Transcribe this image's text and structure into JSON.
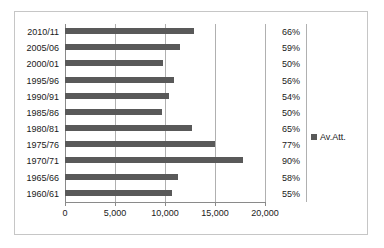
{
  "chart_data": {
    "type": "bar",
    "orientation": "horizontal",
    "title": "",
    "xlabel": "",
    "ylabel": "",
    "xlim": [
      0,
      20000
    ],
    "grid": true,
    "legend_position": "right",
    "categories": [
      "2010/11",
      "2005/06",
      "2000/01",
      "1995/96",
      "1990/91",
      "1985/86",
      "1980/81",
      "1975/76",
      "1970/71",
      "1965/66",
      "1960/61"
    ],
    "series": [
      {
        "name": "Av.Att.",
        "color": "#595959",
        "values": [
          12900,
          11500,
          9800,
          10900,
          10400,
          9700,
          12700,
          15000,
          17800,
          11300,
          10700
        ]
      }
    ],
    "point_labels": {
      "name": "percentage",
      "values": [
        "66%",
        "59%",
        "50%",
        "56%",
        "54%",
        "50%",
        "65%",
        "77%",
        "90%",
        "58%",
        "55%"
      ]
    },
    "xticks": [
      0,
      5000,
      10000,
      15000,
      20000
    ],
    "xtick_labels": [
      "0",
      "5,000",
      "10,000",
      "15,000",
      "20,000"
    ]
  },
  "legend": {
    "label": "Av.Att.",
    "swatch_color": "#595959"
  },
  "style": {
    "border_color": "#c6c6c6",
    "gridline_color": "#b0b0b0",
    "axis_color": "#8a8a8a",
    "bar_color": "#595959",
    "background": "#ffffff"
  }
}
